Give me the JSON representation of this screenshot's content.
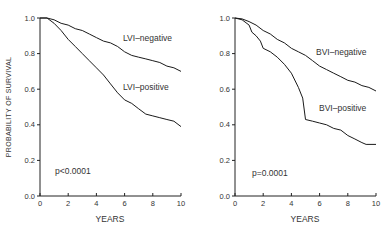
{
  "chart_data": [
    {
      "type": "line",
      "title": "",
      "xlabel": "YEARS",
      "ylabel": "PROBABILITY OF SURVIVAL",
      "xlim": [
        0,
        10
      ],
      "ylim": [
        0.0,
        1.0
      ],
      "xticks": [
        "0",
        "2",
        "4",
        "6",
        "8",
        "10"
      ],
      "yticks": [
        "0.0",
        "0.2",
        "0.4",
        "0.6",
        "0.8",
        "1.0"
      ],
      "grid": false,
      "annotation": "p<0.0001",
      "series": [
        {
          "name": "LVI-negative",
          "x": [
            0,
            0.5,
            1,
            1.5,
            2,
            2.5,
            3,
            3.5,
            4,
            4.5,
            5,
            5.5,
            6,
            6.5,
            7,
            7.5,
            8,
            8.5,
            9,
            9.5,
            10
          ],
          "values": [
            1.0,
            1.0,
            0.99,
            0.97,
            0.96,
            0.94,
            0.93,
            0.91,
            0.89,
            0.87,
            0.86,
            0.84,
            0.81,
            0.79,
            0.78,
            0.77,
            0.76,
            0.75,
            0.73,
            0.72,
            0.7
          ]
        },
        {
          "name": "LVI-positive",
          "x": [
            0,
            0.5,
            1,
            1.5,
            2,
            2.5,
            3,
            3.5,
            4,
            4.5,
            5,
            5.5,
            6,
            6.5,
            7,
            7.5,
            8,
            8.5,
            9,
            9.5,
            10
          ],
          "values": [
            1.0,
            1.0,
            0.97,
            0.93,
            0.88,
            0.84,
            0.8,
            0.76,
            0.72,
            0.68,
            0.63,
            0.58,
            0.54,
            0.52,
            0.49,
            0.46,
            0.45,
            0.44,
            0.43,
            0.42,
            0.39
          ]
        }
      ]
    },
    {
      "type": "line",
      "title": "",
      "xlabel": "YEARS",
      "ylabel": "",
      "xlim": [
        0,
        10
      ],
      "ylim": [
        0.0,
        1.0
      ],
      "xticks": [
        "0",
        "2",
        "4",
        "6",
        "8",
        "10"
      ],
      "yticks": [
        "0.0",
        "0.2",
        "0.4",
        "0.6",
        "0.8",
        "1.0"
      ],
      "grid": false,
      "annotation": "p=0.0001",
      "series": [
        {
          "name": "BVI-negative",
          "x": [
            0,
            0.5,
            1,
            1.5,
            2,
            2.5,
            3,
            3.5,
            4,
            4.5,
            5,
            5.5,
            6,
            6.5,
            7,
            7.5,
            8,
            8.5,
            9,
            9.5,
            10
          ],
          "values": [
            1.0,
            0.995,
            0.98,
            0.96,
            0.93,
            0.91,
            0.88,
            0.86,
            0.83,
            0.81,
            0.79,
            0.76,
            0.73,
            0.71,
            0.69,
            0.67,
            0.65,
            0.64,
            0.62,
            0.61,
            0.59
          ]
        },
        {
          "name": "BVI-positive",
          "x": [
            0,
            0.5,
            1,
            1.2,
            1.5,
            1.8,
            2,
            2.5,
            3,
            3.5,
            4,
            4.5,
            4.8,
            5,
            5.5,
            6,
            6.5,
            7,
            7.5,
            8,
            8.5,
            9,
            9.3,
            10
          ],
          "values": [
            1.0,
            0.99,
            0.96,
            0.92,
            0.9,
            0.87,
            0.83,
            0.81,
            0.78,
            0.74,
            0.69,
            0.61,
            0.55,
            0.43,
            0.42,
            0.41,
            0.4,
            0.38,
            0.37,
            0.34,
            0.32,
            0.3,
            0.29,
            0.29
          ]
        }
      ]
    }
  ],
  "panels": [
    {
      "ylabel": "PROBABILITY OF SURVIVAL",
      "xlabel": "YEARS",
      "pvalue": "p<0.0001",
      "label_neg": "LVI–negative",
      "label_pos": "LVI–positive"
    },
    {
      "ylabel": "",
      "xlabel": "YEARS",
      "pvalue": "p=0.0001",
      "label_neg": "BVI–negative",
      "label_pos": "BVI–positive"
    }
  ]
}
